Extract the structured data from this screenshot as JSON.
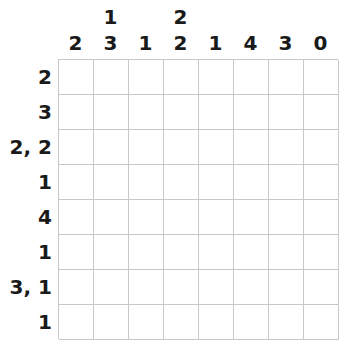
{
  "puzzle": {
    "type": "nonogram",
    "rows": 8,
    "cols": 8,
    "column_clues": [
      [
        2
      ],
      [
        1,
        3
      ],
      [
        1
      ],
      [
        2,
        2
      ],
      [
        1
      ],
      [
        4
      ],
      [
        3
      ],
      [
        0
      ]
    ],
    "row_clues": [
      "2",
      "3",
      "2, 2",
      "1",
      "4",
      "1",
      "3, 1",
      "1"
    ],
    "colors": {
      "grid_line": "#c8c8c8",
      "clue_text": "#1a1a1a",
      "cell_empty": "#ffffff"
    }
  }
}
